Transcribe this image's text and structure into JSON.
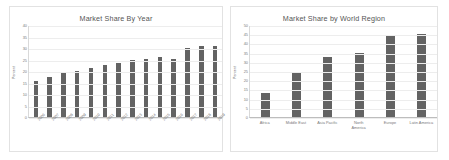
{
  "page": {
    "background": "#ffffff",
    "panel_border_color": "#e2e2e2"
  },
  "charts": [
    {
      "panel_name": "market-share-by-year-panel",
      "title": "Market Share By Year",
      "y_axis_title": "Percent"
    },
    {
      "panel_name": "market-share-by-world-region-panel",
      "title": "Market Share by World Region",
      "y_axis_title": "Percent"
    }
  ],
  "chart_data": [
    {
      "type": "bar",
      "title": "Market Share By Year",
      "xlabel": "",
      "ylabel": "Percent",
      "ylim": [
        0,
        40
      ],
      "yticks": [
        0,
        5,
        10,
        15,
        20,
        25,
        30,
        35,
        40
      ],
      "grid": true,
      "legend": "none",
      "bar_color": "#636363",
      "categories": [
        "2006",
        "2007",
        "2008",
        "2009",
        "2010",
        "2011",
        "2012",
        "2013",
        "2014",
        "2015",
        "2016",
        "2017",
        "2018",
        "2019"
      ],
      "values": [
        15.5,
        17.2,
        19.0,
        20.2,
        21.3,
        22.6,
        23.7,
        24.9,
        25.2,
        25.9,
        25.3,
        30.0,
        31.0,
        31.0
      ]
    },
    {
      "type": "bar",
      "title": "Market Share by World Region",
      "xlabel": "",
      "ylabel": "Percent",
      "ylim": [
        0,
        50
      ],
      "yticks": [
        0,
        5,
        10,
        15,
        20,
        25,
        30,
        35,
        40,
        45,
        50
      ],
      "grid": true,
      "legend": "none",
      "bar_color": "#636363",
      "categories": [
        "Africa",
        "Middle East",
        "Asia Pacific",
        "North\nAmerica",
        "Europe",
        "Latin America"
      ],
      "values": [
        13.0,
        23.8,
        32.5,
        35.0,
        44.5,
        45.0
      ]
    }
  ]
}
